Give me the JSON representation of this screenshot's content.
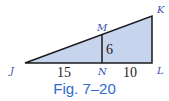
{
  "figure": {
    "caption": "Fig. 7–20",
    "vertices": {
      "J": "J",
      "K": "K",
      "L": "L",
      "M": "M",
      "N": "N"
    },
    "measures": {
      "JN": "15",
      "NL": "10",
      "MN": "6"
    },
    "colors": {
      "fill": "#c6d4ee",
      "stroke": "#1a1a1a",
      "label": "#3a4fb0",
      "caption": "#2e6ad6"
    }
  }
}
